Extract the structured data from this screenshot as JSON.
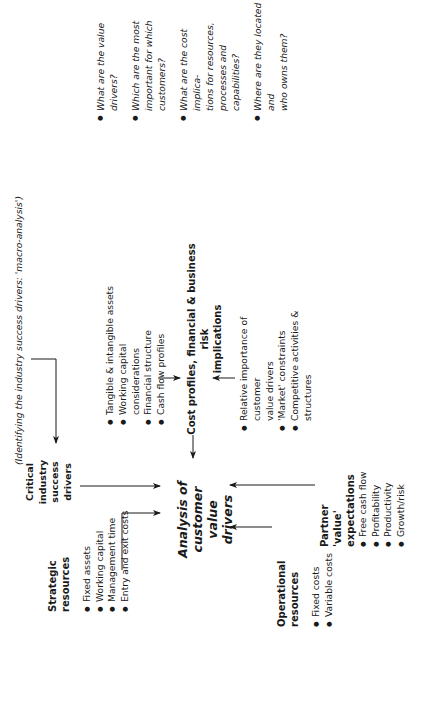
{
  "diagram": {
    "note": "(Identifying the industry success drivers: 'macro-analysis')",
    "center": {
      "line1": "Analysis of",
      "line2": "customer value",
      "line3": "drivers"
    },
    "critical_drivers": {
      "line1": "Critical",
      "line2": "industry",
      "line3": "success",
      "line4": "drivers"
    },
    "strategic_resources": {
      "title": "Strategic resources",
      "items": [
        "Fixed assets",
        "Working capital",
        "Management time",
        "Entry and exit costs"
      ]
    },
    "operational_resources": {
      "title": "Operational resources",
      "items": [
        "Fixed costs",
        "Variable costs"
      ]
    },
    "partner_expectations": {
      "title_line1": "Partner",
      "title_line2": "'value'",
      "title_line3": "expectations",
      "items": [
        "Free cash flow",
        "Profitability",
        "Productivity",
        "Growth/risk"
      ]
    },
    "financial_factors": {
      "items": [
        "Tangible & intangible assets",
        "Working capital considerations",
        "Financial structure",
        "Cash flow profiles"
      ]
    },
    "cost_profiles": {
      "line1": "Cost profiles, financial & business risk",
      "line2": "implications"
    },
    "market_factors": {
      "items": [
        "Relative importance of customer",
        "value drivers",
        "'Market' constraints",
        "Competitive activities & structures"
      ]
    },
    "questions": {
      "items": [
        [
          "What are the value drivers?"
        ],
        [
          "Which are the most",
          "important for which",
          "customers?"
        ],
        [
          "What are the cost implica-",
          "tions for resources,",
          "processes and capabilities?"
        ],
        [
          "Where are they located and",
          "who owns them?"
        ]
      ]
    },
    "colors": {
      "ink": "#1a1a1a",
      "background": "#ffffff"
    }
  }
}
